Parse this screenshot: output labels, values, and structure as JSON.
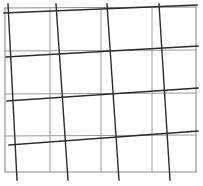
{
  "figure": {
    "canvas": {
      "width": 203,
      "height": 186,
      "background": "#ffffff"
    },
    "colors": {
      "background": "#ffffff",
      "base_grid": "#9a9a9a",
      "skew_grid": "#2b2b2b",
      "border": "#8d8d8d"
    },
    "chart_data": {
      "type": "line",
      "title": "skewed-grid-overlay",
      "xlabel": "",
      "ylabel": "",
      "xlim": [
        0,
        203
      ],
      "ylim": [
        0,
        186
      ],
      "grid": true,
      "legend": "none",
      "annotations": [
        "Light gray axis-aligned rectangular grid",
        "Darker hand-drawn grid rotated a few degrees over it"
      ],
      "series": [
        {
          "name": "base-grid-border",
          "style": "thin-gray",
          "color": "#8d8d8d",
          "width": 1.1,
          "segments": [
            [
              5,
              8,
              196,
              7
            ],
            [
              196,
              7,
              196,
              172
            ],
            [
              196,
              172,
              5,
              172
            ],
            [
              5,
              172,
              5,
              8
            ]
          ]
        },
        {
          "name": "base-grid-horizontals",
          "style": "thin-gray",
          "color": "#9a9a9a",
          "width": 1.0,
          "segments": [
            [
              5,
              51,
              196,
              50
            ],
            [
              5,
              94,
              196,
              93
            ],
            [
              5,
              136,
              196,
              135
            ]
          ]
        },
        {
          "name": "base-grid-verticals",
          "style": "thin-gray",
          "color": "#9a9a9a",
          "width": 1.0,
          "segments": [
            [
              50,
              8,
              50,
              172
            ],
            [
              101,
              8,
              101,
              172
            ],
            [
              152,
              8,
              152,
              172
            ]
          ]
        },
        {
          "name": "skew-grid-horizontals",
          "style": "dark-ink",
          "color": "#2b2b2b",
          "width": 1.4,
          "segments": [
            [
              4,
              13,
              197,
              5
            ],
            [
              6,
              57,
              198,
              46
            ],
            [
              7,
              101,
              198,
              88
            ],
            [
              9,
              145,
              198,
              131
            ]
          ]
        },
        {
          "name": "skew-grid-verticals",
          "style": "dark-ink",
          "color": "#2b2b2b",
          "width": 1.4,
          "segments": [
            [
              8,
              4,
              17,
              180
            ],
            [
              56,
              4,
              68,
              180
            ],
            [
              107,
              4,
              119,
              180
            ],
            [
              159,
              4,
              170,
              180
            ]
          ]
        }
      ]
    }
  }
}
